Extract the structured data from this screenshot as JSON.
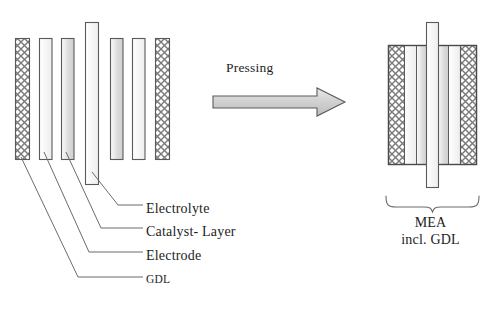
{
  "diagram": {
    "process_label": "Pressing",
    "colors": {
      "stroke": "#5a5a5a",
      "stroke_dark": "#4a4a4a",
      "leader": "#6b6b6b",
      "text": "#1d1d1d",
      "fill_light": "#f4f4f4",
      "fill_mid": "#d9d9d9",
      "fill_dark": "#c2c2c2",
      "hatch": "#7a7a7a",
      "arrow_fill": "#d0d0d0"
    },
    "left_stack": {
      "name": "exploded-layer-stack",
      "layers": [
        {
          "id": "gdl-left",
          "type": "GDL",
          "pattern": "crosshatch",
          "x": 15,
          "y": 38,
          "w": 14,
          "h": 122
        },
        {
          "id": "electrode-left",
          "type": "Electrode",
          "pattern": "gradient",
          "x": 39,
          "y": 38,
          "w": 13,
          "h": 122
        },
        {
          "id": "catalyst-left",
          "type": "Catalyst- Layer",
          "pattern": "gradient",
          "x": 61,
          "y": 38,
          "w": 13,
          "h": 122
        },
        {
          "id": "electrolyte",
          "type": "Electrolyte",
          "pattern": "plain",
          "x": 85,
          "y": 22,
          "w": 13,
          "h": 163
        },
        {
          "id": "catalyst-right",
          "type": "Catalyst- Layer",
          "pattern": "gradient",
          "x": 110,
          "y": 38,
          "w": 13,
          "h": 122
        },
        {
          "id": "electrode-right",
          "type": "Electrode",
          "pattern": "gradient",
          "x": 132,
          "y": 38,
          "w": 13,
          "h": 122
        },
        {
          "id": "gdl-right",
          "type": "GDL",
          "pattern": "crosshatch",
          "x": 155,
          "y": 38,
          "w": 14,
          "h": 122
        }
      ]
    },
    "arrow": {
      "name": "pressing-arrow",
      "x": 212,
      "y": 88,
      "w": 133,
      "h": 28
    },
    "right_stack": {
      "name": "pressed-mea-assembly",
      "x": 388,
      "y": 45,
      "w": 88,
      "h": 120,
      "layers": [
        {
          "id": "mea-gdl-left",
          "type": "GDL",
          "pattern": "crosshatch",
          "x": 388,
          "y": 45,
          "w": 16,
          "h": 120
        },
        {
          "id": "mea-electrode-left",
          "type": "Electrode",
          "pattern": "gradient",
          "x": 404,
          "y": 45,
          "w": 13,
          "h": 120
        },
        {
          "id": "mea-catalyst-left",
          "type": "Catalyst- Layer",
          "pattern": "gradient",
          "x": 417,
          "y": 45,
          "w": 13,
          "h": 120
        },
        {
          "id": "mea-electrolyte",
          "type": "Electrolyte",
          "pattern": "plain",
          "x": 426,
          "y": 22,
          "w": 13,
          "h": 166
        },
        {
          "id": "mea-catalyst-right",
          "type": "Catalyst- Layer",
          "pattern": "gradient",
          "x": 436,
          "y": 45,
          "w": 13,
          "h": 120
        },
        {
          "id": "mea-electrode-right",
          "type": "Electrode",
          "pattern": "gradient",
          "x": 449,
          "y": 45,
          "w": 13,
          "h": 120
        },
        {
          "id": "mea-gdl-right",
          "type": "GDL",
          "pattern": "crosshatch",
          "x": 462,
          "y": 45,
          "w": 15,
          "h": 120
        }
      ],
      "brace": {
        "name": "mea-brace",
        "x1": 385,
        "x2": 478,
        "y": 196
      }
    },
    "labels": {
      "electrolyte": "Electrolyte",
      "catalyst_layer": "Catalyst- Layer",
      "electrode": "Electrode",
      "gdl": "GDL",
      "mea_line1": "MEA",
      "mea_line2": "incl.  GDL"
    },
    "leader_lines": [
      {
        "name": "leader-electrolyte",
        "target": "Electrolyte",
        "points": "92,173 118,205 143,205"
      },
      {
        "name": "leader-catalyst-layer",
        "target": "Catalyst- Layer",
        "points": "66,153 100,228 143,228"
      },
      {
        "name": "leader-electrode",
        "target": "Electrode",
        "points": "44,153 88,252 143,252"
      },
      {
        "name": "leader-gdl",
        "target": "GDL",
        "points": "21,158 77,277 143,277"
      }
    ]
  }
}
